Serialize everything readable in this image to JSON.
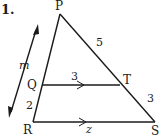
{
  "problem": {
    "number": "1."
  },
  "diagram": {
    "vertices": {
      "P": {
        "label": "P",
        "x": 60,
        "y": 14
      },
      "Q": {
        "label": "Q",
        "x": 42,
        "y": 85
      },
      "R": {
        "label": "R",
        "x": 33,
        "y": 122
      },
      "T": {
        "label": "T",
        "x": 120,
        "y": 85
      },
      "S": {
        "label": "S",
        "x": 155,
        "y": 122
      }
    },
    "segment_labels": {
      "PT": "5",
      "QT": "3",
      "TS": "3",
      "QR": "2",
      "RS": "z"
    },
    "transversal_label": "m",
    "parallel_segments": [
      "QT",
      "RS"
    ],
    "stroke_color": "#1a1a1a"
  }
}
